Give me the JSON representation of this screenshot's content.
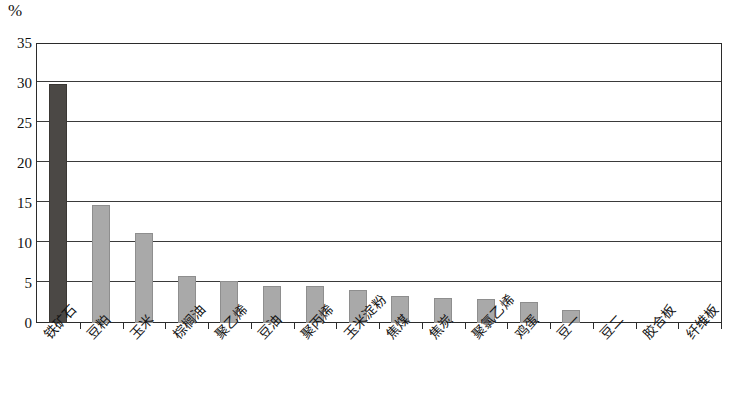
{
  "chart_data": {
    "type": "bar",
    "title": "",
    "subtitle": "",
    "xlabel": "",
    "ylabel": "%",
    "unit_label": "%",
    "ylim": [
      0,
      35
    ],
    "ytick_values": [
      0,
      5,
      10,
      15,
      20,
      25,
      30,
      35
    ],
    "ytick_labels": [
      "0",
      "5",
      "10",
      "15",
      "20",
      "25",
      "30",
      "35"
    ],
    "grid": true,
    "grid_axis": "y",
    "legend": false,
    "legend_position": "none",
    "categories": [
      "铁矿石",
      "豆粕",
      "玉米",
      "棕榈油",
      "聚乙烯",
      "豆油",
      "聚丙烯",
      "玉米淀粉",
      "焦煤",
      "焦炭",
      "聚氯乙烯",
      "鸡蛋",
      "豆一",
      "豆二",
      "胶合板",
      "纤维板"
    ],
    "values": [
      30.0,
      14.9,
      11.4,
      6.0,
      5.4,
      4.7,
      4.7,
      4.2,
      3.5,
      3.3,
      3.1,
      2.8,
      1.8,
      0.0,
      0.0,
      0.0
    ],
    "series": [
      {
        "name": "占比",
        "values": [
          30.0,
          14.9,
          11.4,
          6.0,
          5.4,
          4.7,
          4.7,
          4.2,
          3.5,
          3.3,
          3.1,
          2.8,
          1.8,
          0.0,
          0.0,
          0.0
        ]
      }
    ],
    "colors": {
      "bar_default": "#a9a9a9",
      "bar_highlight": "#4b4845",
      "axis": "#2b2b2b",
      "grid": "#3a3a3a",
      "background": "#ffffff",
      "text": "#141414"
    },
    "highlight_index": 0
  }
}
